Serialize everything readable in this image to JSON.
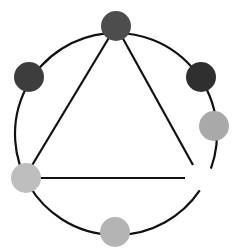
{
  "diagram": {
    "width": 241,
    "height": 248,
    "background": "#ffffff",
    "stroke_color": "#111111",
    "ring": {
      "cx": 116,
      "cy": 134,
      "r": 101
    },
    "triangle": {
      "apex": [
        116,
        26
      ],
      "bottom_left": [
        34,
        178
      ],
      "bottom_right": [
        185,
        178
      ],
      "right_end": [
        193,
        165
      ]
    },
    "nodes": [
      {
        "id": "top",
        "cx": 116,
        "cy": 26,
        "r": 15,
        "color": "#4d4d4d"
      },
      {
        "id": "upper-left",
        "cx": 29,
        "cy": 77,
        "r": 15,
        "color": "#3d3d3d"
      },
      {
        "id": "upper-right",
        "cx": 201,
        "cy": 77,
        "r": 15,
        "color": "#2f2f2f"
      },
      {
        "id": "right",
        "cx": 214,
        "cy": 126,
        "r": 15,
        "color": "#a9a9a9"
      },
      {
        "id": "lower-left",
        "cx": 26,
        "cy": 178,
        "r": 15,
        "color": "#bebebe"
      },
      {
        "id": "bottom",
        "cx": 115,
        "cy": 232,
        "r": 15,
        "color": "#b4b4b4"
      }
    ]
  }
}
